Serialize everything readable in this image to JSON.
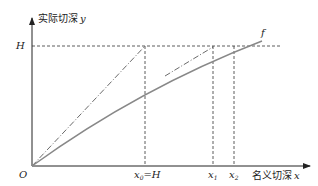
{
  "diagram": {
    "y_axis_label": "实际切深",
    "y_axis_var": "y",
    "x_axis_label": "名义切深",
    "x_axis_var": "x",
    "origin_label": "O",
    "h_label": "H",
    "curve_label": "f",
    "x0_label": "x",
    "x0_sub": "0",
    "x0_eq": "=H",
    "x1_label": "x",
    "x1_sub": "1",
    "x2_label": "x",
    "x2_sub": "2",
    "colors": {
      "axis": "#222222",
      "curve": "#888888",
      "dashed": "#333333",
      "dashdot": "#444444"
    }
  }
}
